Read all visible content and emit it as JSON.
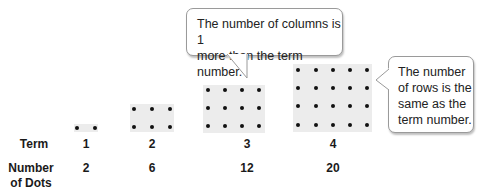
{
  "row_labels": {
    "term": "Term",
    "number_of_dots_line1": "Number",
    "number_of_dots_line2": "of Dots"
  },
  "terms": [
    {
      "term": "1",
      "dots": "2",
      "rows": 1,
      "columns": 2
    },
    {
      "term": "2",
      "dots": "6",
      "rows": 2,
      "columns": 3
    },
    {
      "term": "3",
      "dots": "12",
      "rows": 3,
      "columns": 4
    },
    {
      "term": "4",
      "dots": "20",
      "rows": 4,
      "columns": 5
    }
  ],
  "callouts": {
    "columns": "The number of columns is 1 more than the term number.",
    "columns_line1": "The number of columns is 1",
    "columns_line2": "more than the term number.",
    "rows_line1": "The number",
    "rows_line2": "of rows is the",
    "rows_line3": "same as the",
    "rows_line4": "term number."
  },
  "colors": {
    "grid_background": "#ececec",
    "dot": "#111111",
    "callout_border": "#9a9a9a"
  }
}
